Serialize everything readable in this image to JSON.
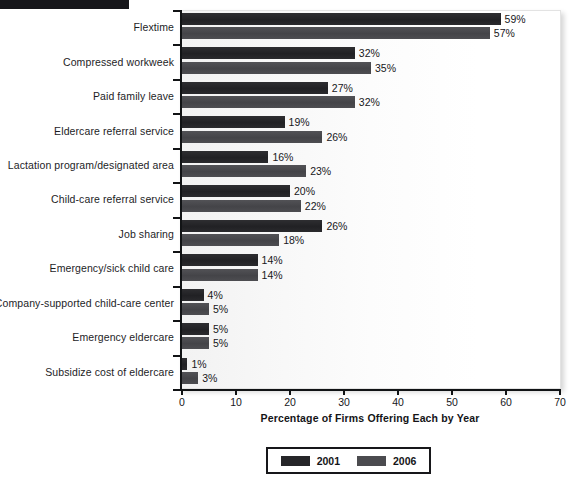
{
  "page": {
    "top_band": "black-band-artifact"
  },
  "chart_data": {
    "type": "bar",
    "orientation": "horizontal",
    "title": "",
    "xlabel": "Percentage of Firms Offering Each by Year",
    "ylabel": "",
    "xlim": [
      0,
      70
    ],
    "xticks": [
      0,
      10,
      20,
      30,
      40,
      50,
      60,
      70
    ],
    "xtick_labels": [
      "0",
      "10",
      "20",
      "30",
      "40",
      "50",
      "60",
      "70"
    ],
    "grid": false,
    "legend_position": "bottom-center",
    "value_suffix": "%",
    "categories": [
      "Flextime",
      "Compressed workweek",
      "Paid family leave",
      "Eldercare referral service",
      "Lactation program/designated area",
      "Child-care referral service",
      "Job sharing",
      "Emergency/sick child care",
      "Company-supported child-care center",
      "Emergency eldercare",
      "Subsidize cost of eldercare"
    ],
    "series": [
      {
        "name": "2001",
        "color": "#262629",
        "values": [
          59,
          32,
          27,
          19,
          16,
          20,
          26,
          14,
          4,
          5,
          1
        ],
        "labels": [
          "59%",
          "32%",
          "27%",
          "19%",
          "16%",
          "20%",
          "26%",
          "14%",
          "4%",
          "5%",
          "1%"
        ]
      },
      {
        "name": "2006",
        "color": "#4b4b4f",
        "values": [
          57,
          35,
          32,
          26,
          23,
          22,
          18,
          14,
          5,
          5,
          3
        ],
        "labels": [
          "57%",
          "35%",
          "32%",
          "26%",
          "23%",
          "22%",
          "18%",
          "14%",
          "5%",
          "5%",
          "3%"
        ]
      }
    ]
  }
}
